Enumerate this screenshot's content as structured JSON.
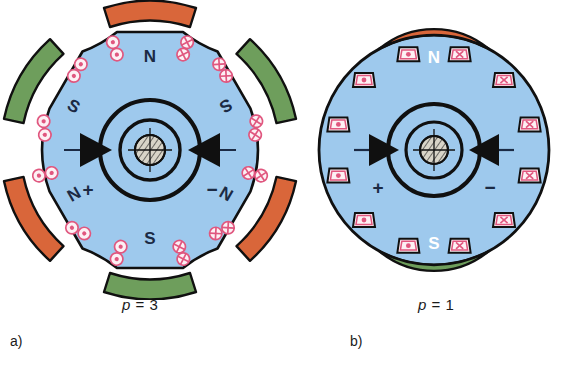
{
  "figure": {
    "background": "#ffffff",
    "panels": [
      {
        "id": "a",
        "label": "a)",
        "caption_var": "p",
        "caption_rel": "=",
        "caption_value": "3",
        "caption_full": "p = 3",
        "machine_type": "salient-pole rotor, 6 poles",
        "rotor_color": "#9ec9ed",
        "outline_color": "#101010",
        "pole_count": 6,
        "pole_labels": [
          "N",
          "S",
          "N",
          "S",
          "N",
          "S"
        ],
        "pole_label_color": "#1b2a44",
        "stator_arcs": [
          {
            "over_pole": "N",
            "color": "#d9663a"
          },
          {
            "over_pole": "S",
            "color": "#6e9e5c"
          },
          {
            "over_pole": "N",
            "color": "#d9663a"
          },
          {
            "over_pole": "S",
            "color": "#6e9e5c"
          },
          {
            "over_pole": "N",
            "color": "#d9663a"
          },
          {
            "over_pole": "S",
            "color": "#6e9e5c"
          }
        ],
        "coil_symbol_left": "dot",
        "coil_symbol_right": "cross",
        "coil_color": "#e0577f",
        "coil_fill": "#fdf0f4",
        "brush_left_sign": "+",
        "brush_right_sign": "−",
        "brush_color": "#101010"
      },
      {
        "id": "b",
        "label": "b)",
        "caption_var": "p",
        "caption_rel": "=",
        "caption_value": "1",
        "caption_full": "p = 1",
        "machine_type": "round rotor, 2 poles, 12 slots",
        "rotor_color": "#9ec9ed",
        "outline_color": "#101010",
        "slot_count": 12,
        "pole_labels": [
          "N",
          "S"
        ],
        "pole_label_color": "#ffffff",
        "stator_poles": [
          {
            "label": "N",
            "color": "#d9663a",
            "position": "top"
          },
          {
            "label": "S",
            "color": "#6e9e5c",
            "position": "bottom"
          }
        ],
        "coil_symbol_left": "dot",
        "coil_symbol_right": "cross",
        "coil_color": "#e0577f",
        "coil_fill": "#fdf0f4",
        "brush_left_sign": "+",
        "brush_right_sign": "−",
        "brush_color": "#101010"
      }
    ],
    "hub": {
      "shaft_fill": "#d8d4c8",
      "hatch_color": "#101010",
      "ring_color": "#101010"
    }
  }
}
